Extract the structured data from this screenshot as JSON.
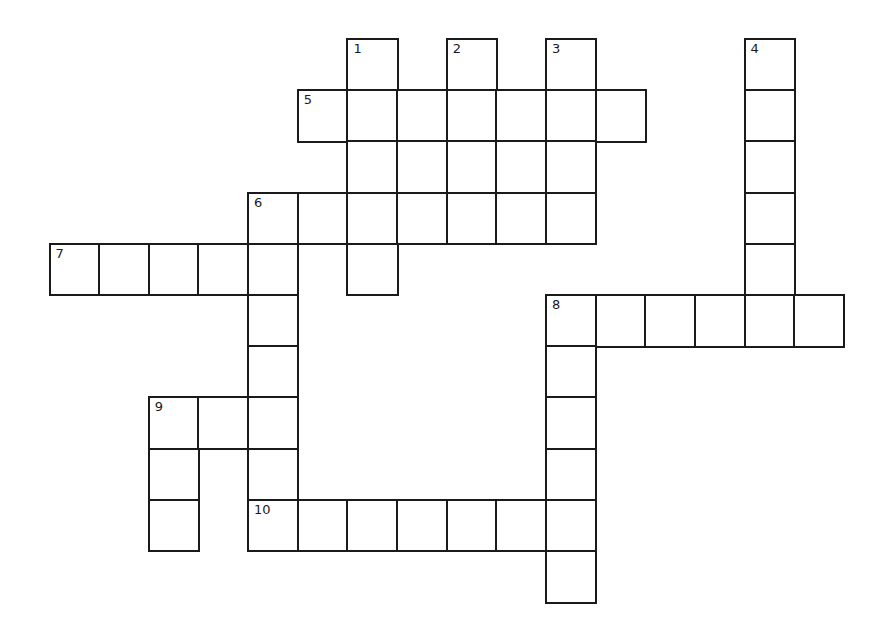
{
  "puzzle": {
    "layout": {
      "origin_x": 48.5,
      "origin_y": 38,
      "cell_w": 49.65,
      "cell_h": 51.2,
      "border_color": "#1a1a1a",
      "background": "#ffffff"
    },
    "clue_numbers": [
      {
        "number": "1",
        "row": 0,
        "col": 6
      },
      {
        "number": "2",
        "row": 0,
        "col": 8
      },
      {
        "number": "3",
        "row": 0,
        "col": 10
      },
      {
        "number": "4",
        "row": 0,
        "col": 14
      },
      {
        "number": "5",
        "row": 1,
        "col": 5
      },
      {
        "number": "6",
        "row": 3,
        "col": 4
      },
      {
        "number": "7",
        "row": 4,
        "col": 0
      },
      {
        "number": "8",
        "row": 5,
        "col": 10
      },
      {
        "number": "9",
        "row": 7,
        "col": 2
      },
      {
        "number": "10",
        "row": 9,
        "col": 4
      }
    ],
    "cells": [
      [
        0,
        6
      ],
      [
        0,
        8
      ],
      [
        0,
        10
      ],
      [
        0,
        14
      ],
      [
        1,
        5
      ],
      [
        1,
        6
      ],
      [
        1,
        7
      ],
      [
        1,
        8
      ],
      [
        1,
        9
      ],
      [
        1,
        10
      ],
      [
        1,
        11
      ],
      [
        1,
        14
      ],
      [
        2,
        6
      ],
      [
        2,
        7
      ],
      [
        2,
        8
      ],
      [
        2,
        9
      ],
      [
        2,
        10
      ],
      [
        2,
        14
      ],
      [
        3,
        4
      ],
      [
        3,
        5
      ],
      [
        3,
        6
      ],
      [
        3,
        7
      ],
      [
        3,
        8
      ],
      [
        3,
        9
      ],
      [
        3,
        10
      ],
      [
        3,
        14
      ],
      [
        4,
        0
      ],
      [
        4,
        1
      ],
      [
        4,
        2
      ],
      [
        4,
        3
      ],
      [
        4,
        4
      ],
      [
        4,
        6
      ],
      [
        4,
        14
      ],
      [
        5,
        4
      ],
      [
        5,
        10
      ],
      [
        5,
        11
      ],
      [
        5,
        12
      ],
      [
        5,
        13
      ],
      [
        5,
        14
      ],
      [
        5,
        15
      ],
      [
        6,
        4
      ],
      [
        6,
        10
      ],
      [
        7,
        2
      ],
      [
        7,
        3
      ],
      [
        7,
        4
      ],
      [
        7,
        10
      ],
      [
        8,
        2
      ],
      [
        8,
        4
      ],
      [
        8,
        10
      ],
      [
        9,
        2
      ],
      [
        9,
        4
      ],
      [
        9,
        5
      ],
      [
        9,
        6
      ],
      [
        9,
        7
      ],
      [
        9,
        8
      ],
      [
        9,
        9
      ],
      [
        9,
        10
      ],
      [
        10,
        10
      ]
    ],
    "entries": {
      "across": [
        {
          "number": "5",
          "row": 1,
          "col": 5,
          "length": 7
        },
        {
          "number": "6",
          "row": 3,
          "col": 4,
          "length": 7
        },
        {
          "number": "7",
          "row": 4,
          "col": 0,
          "length": 5
        },
        {
          "number": "8",
          "row": 5,
          "col": 10,
          "length": 6
        },
        {
          "number": "9",
          "row": 7,
          "col": 2,
          "length": 3
        },
        {
          "number": "10",
          "row": 9,
          "col": 4,
          "length": 7
        }
      ],
      "down": [
        {
          "number": "1",
          "row": 0,
          "col": 6,
          "length": 5
        },
        {
          "number": "2",
          "row": 0,
          "col": 8,
          "length": 4
        },
        {
          "number": "3",
          "row": 0,
          "col": 10,
          "length": 4
        },
        {
          "number": "4",
          "row": 0,
          "col": 14,
          "length": 6
        },
        {
          "number": "6",
          "row": 3,
          "col": 4,
          "length": 7
        },
        {
          "number": "8",
          "row": 5,
          "col": 10,
          "length": 6
        },
        {
          "number": "9",
          "row": 7,
          "col": 2,
          "length": 3
        }
      ]
    }
  }
}
